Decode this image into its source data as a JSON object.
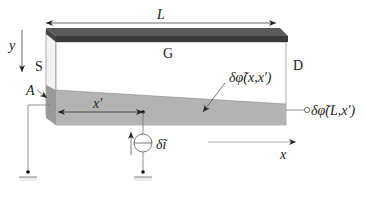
{
  "diagram": {
    "labels": {
      "length": "L",
      "gate": "G",
      "source": "S",
      "drain": "D",
      "y_axis": "y",
      "x_axis": "x",
      "point_a": "A",
      "x_prime": "x'",
      "potential": "δφ̃(x,x')",
      "output_potential": "δφ̃(L,x')",
      "current_source": "δĩ"
    },
    "colors": {
      "gate": "#4a4a4a",
      "gate_edge": "#2e2e2e",
      "channel": "#b3b3b3",
      "channel_side": "#9a9a9a",
      "box_outline": "#8a8a8a",
      "line": "#555555"
    }
  }
}
